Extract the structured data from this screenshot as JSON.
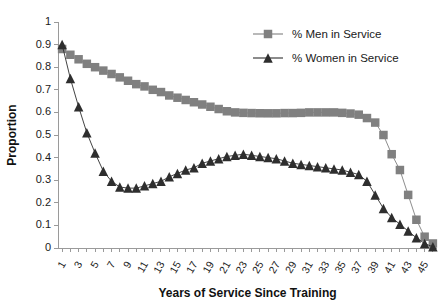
{
  "chart_data": {
    "type": "line",
    "title": "",
    "xlabel": "Years of Service Since Training",
    "ylabel": "Proportion",
    "xlim": [
      0.5,
      46.5
    ],
    "ylim": [
      0,
      1
    ],
    "yticks": [
      "0",
      "0.1",
      "0.2",
      "0.3",
      "0.4",
      "0.5",
      "0.6",
      "0.7",
      "0.8",
      "0.9",
      "1"
    ],
    "ytick_values": [
      0,
      0.1,
      0.2,
      0.3,
      0.4,
      0.5,
      0.6,
      0.7,
      0.8,
      0.9,
      1
    ],
    "xticks": [
      "1",
      "3",
      "5",
      "7",
      "9",
      "11",
      "13",
      "15",
      "17",
      "19",
      "21",
      "23",
      "25",
      "27",
      "29",
      "31",
      "33",
      "35",
      "37",
      "39",
      "41",
      "43",
      "45"
    ],
    "xtick_values": [
      1,
      3,
      5,
      7,
      9,
      11,
      13,
      15,
      17,
      19,
      21,
      23,
      25,
      27,
      29,
      31,
      33,
      35,
      37,
      39,
      41,
      43,
      45
    ],
    "x": [
      1,
      2,
      3,
      4,
      5,
      6,
      7,
      8,
      9,
      10,
      11,
      12,
      13,
      14,
      15,
      16,
      17,
      18,
      19,
      20,
      21,
      22,
      23,
      24,
      25,
      26,
      27,
      28,
      29,
      30,
      31,
      32,
      33,
      34,
      35,
      36,
      37,
      38,
      39,
      40,
      41,
      42,
      43,
      44,
      45,
      46
    ],
    "grid": false,
    "legend_position": "top-right",
    "series": [
      {
        "name": "% Men in Service",
        "marker": "square",
        "color": "#808080",
        "values": [
          0.88,
          0.855,
          0.835,
          0.815,
          0.8,
          0.785,
          0.77,
          0.755,
          0.74,
          0.725,
          0.715,
          0.7,
          0.69,
          0.675,
          0.665,
          0.655,
          0.645,
          0.635,
          0.625,
          0.615,
          0.605,
          0.6,
          0.598,
          0.597,
          0.596,
          0.596,
          0.596,
          0.597,
          0.597,
          0.598,
          0.6,
          0.6,
          0.6,
          0.6,
          0.598,
          0.595,
          0.59,
          0.575,
          0.555,
          0.5,
          0.415,
          0.345,
          0.235,
          0.125,
          0.05,
          0.02
        ]
      },
      {
        "name": "% Women in Service",
        "marker": "triangle",
        "color": "#2e2e2e",
        "values": [
          0.9,
          0.75,
          0.625,
          0.51,
          0.42,
          0.34,
          0.295,
          0.27,
          0.265,
          0.265,
          0.275,
          0.285,
          0.295,
          0.315,
          0.33,
          0.345,
          0.355,
          0.375,
          0.385,
          0.395,
          0.405,
          0.41,
          0.415,
          0.41,
          0.405,
          0.4,
          0.395,
          0.385,
          0.375,
          0.37,
          0.365,
          0.36,
          0.355,
          0.35,
          0.345,
          0.335,
          0.325,
          0.295,
          0.235,
          0.175,
          0.135,
          0.105,
          0.075,
          0.045,
          0.02,
          0.005
        ]
      }
    ]
  },
  "legend": {
    "items": [
      {
        "label": "% Men in Service",
        "color": "#808080",
        "marker": "square"
      },
      {
        "label": "% Women in Service",
        "color": "#2e2e2e",
        "marker": "triangle"
      }
    ]
  },
  "axes": {
    "x_title": "Years of Service Since Training",
    "y_title": "Proportion"
  }
}
